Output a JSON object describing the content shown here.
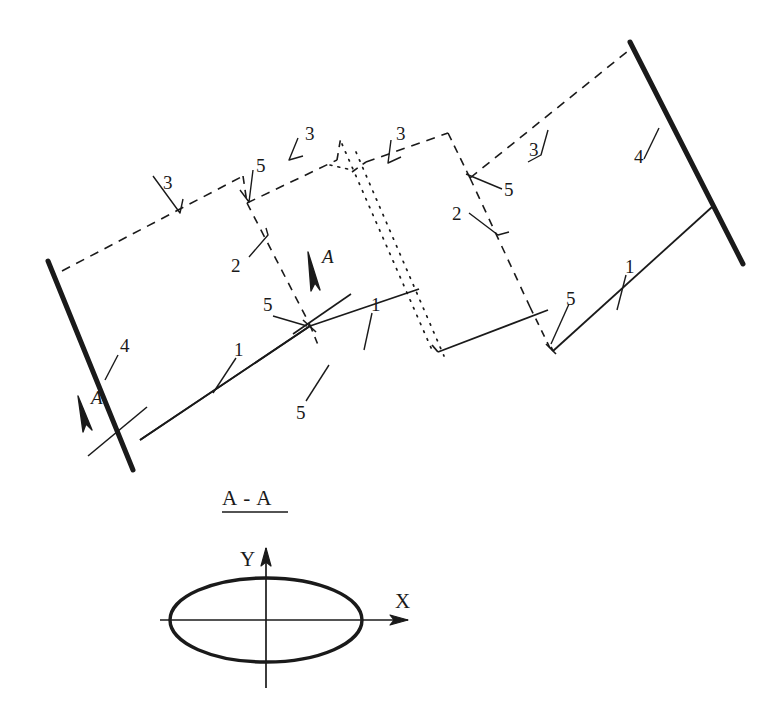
{
  "figure": {
    "kind": "engineering-assembly-drawing",
    "background_color": "#ffffff",
    "ink_color": "#1a1a1a",
    "main_view": {
      "name": "isometric-assembly-view",
      "description": "Inclined multi-panel frame structure drawn in oblique projection with two heavy end posts, hidden (dashed) rear edges, visible (solid) front edges and dotted interior edges."
    },
    "section_view": {
      "title": "A - A",
      "name": "section-a-a",
      "shape": "ellipse",
      "axis_x_label": "X",
      "axis_y_label": "Y"
    },
    "section_arrows": [
      {
        "label": "A",
        "name": "section-arrow-left"
      },
      {
        "label": "A",
        "name": "section-arrow-middle"
      }
    ],
    "callouts": [
      {
        "id": "c1",
        "label": "1",
        "name": "callout-1-left-bottom"
      },
      {
        "id": "c2",
        "label": "1",
        "name": "callout-1-middle-bottom"
      },
      {
        "id": "c3",
        "label": "1",
        "name": "callout-1-right-bottom"
      },
      {
        "id": "c4",
        "label": "2",
        "name": "callout-2-left"
      },
      {
        "id": "c5",
        "label": "2",
        "name": "callout-2-right"
      },
      {
        "id": "c6",
        "label": "3",
        "name": "callout-3-far-left"
      },
      {
        "id": "c7",
        "label": "3",
        "name": "callout-3-center-left"
      },
      {
        "id": "c8",
        "label": "3",
        "name": "callout-3-center-right"
      },
      {
        "id": "c9",
        "label": "3",
        "name": "callout-3-far-right"
      },
      {
        "id": "c10",
        "label": "4",
        "name": "callout-4-left-post"
      },
      {
        "id": "c11",
        "label": "4",
        "name": "callout-4-right-post"
      },
      {
        "id": "c12",
        "label": "5",
        "name": "callout-5-top-left"
      },
      {
        "id": "c13",
        "label": "5",
        "name": "callout-5-mid-left"
      },
      {
        "id": "c14",
        "label": "5",
        "name": "callout-5-low-left"
      },
      {
        "id": "c15",
        "label": "5",
        "name": "callout-5-top-right"
      },
      {
        "id": "c16",
        "label": "5",
        "name": "callout-5-low-right"
      }
    ]
  }
}
